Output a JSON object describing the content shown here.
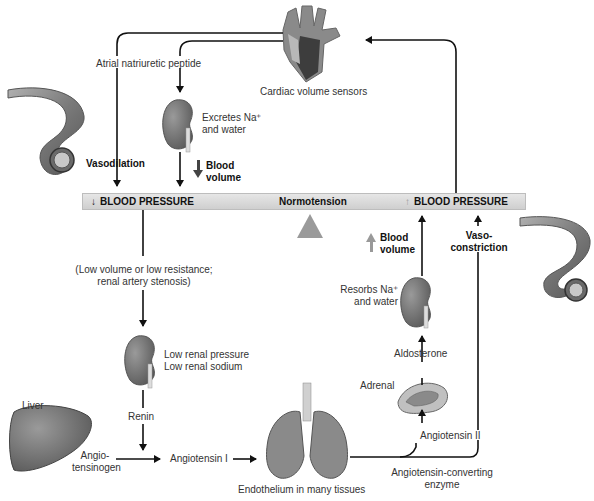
{
  "diagram": {
    "bar": {
      "left_label": "BLOOD PRESSURE",
      "left_arrow": "down",
      "center_label": "Normotension",
      "right_label": "BLOOD PRESSURE",
      "right_arrow": "up",
      "color": "#d8d8d8"
    },
    "nodes": {
      "heart": {
        "label": "Cardiac volume sensors"
      },
      "anp": {
        "label": "Atrial natriuretic peptide"
      },
      "kidney_top": {
        "label_line1": "Excretes Na⁺",
        "label_line2": "and water"
      },
      "blood_volume_down": {
        "line1": "Blood",
        "line2": "volume",
        "arrow": "down"
      },
      "vasodilation": {
        "label": "Vasodilation"
      },
      "low_volume": {
        "line1": "(Low volume or low resistance;",
        "line2": "renal artery stenosis)"
      },
      "kidney_mid": {
        "line1": "Low renal pressure",
        "line2": "Low renal sodium"
      },
      "renin": {
        "label": "Renin"
      },
      "liver": {
        "label": "Liver"
      },
      "angiotensinogen": {
        "line1": "Angio-",
        "line2": "tensinogen"
      },
      "angiotensin1": {
        "label": "Angiotensin I"
      },
      "lungs": {
        "label": "Endothelium in many tissues"
      },
      "ace": {
        "line1": "Angiotensin-converting",
        "line2": "enzyme"
      },
      "angiotensin2": {
        "label": "Angiotensin II"
      },
      "adrenal": {
        "label": "Adrenal"
      },
      "aldosterone": {
        "label": "Aldosterone"
      },
      "kidney_right": {
        "line1": "Resorbs Na⁺",
        "line2": "and water"
      },
      "blood_volume_up": {
        "line1": "Blood",
        "line2": "volume",
        "arrow": "up"
      },
      "vasoconstriction": {
        "line1": "Vaso-",
        "line2": "constriction"
      }
    },
    "colors": {
      "organ_gray": "#7a7a7a",
      "organ_dark": "#4a4a4a",
      "line": "#111111",
      "fulcrum": "#9a9a9a"
    }
  }
}
